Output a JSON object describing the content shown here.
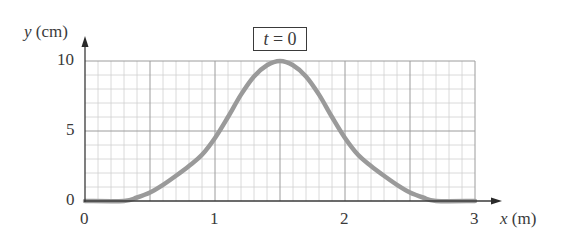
{
  "chart_data": {
    "type": "line",
    "title": "t = 0",
    "xlabel": "x (m)",
    "ylabel": "y (cm)",
    "xlim": [
      0,
      3
    ],
    "ylim": [
      0,
      10
    ],
    "x_ticks": [
      "0",
      "1",
      "2",
      "3"
    ],
    "y_ticks": [
      "0",
      "5",
      "10"
    ],
    "grid": true,
    "grid_minor_x_step": 0.1,
    "grid_minor_y_step": 1,
    "legend": null,
    "series": [
      {
        "name": "pulse at t = 0",
        "color": "#9a9a9a",
        "x": [
          0,
          0.3,
          0.4,
          0.5,
          0.6,
          0.7,
          0.8,
          0.9,
          1.0,
          1.1,
          1.2,
          1.3,
          1.4,
          1.5,
          1.6,
          1.7,
          1.8,
          1.9,
          2.0,
          2.1,
          2.2,
          2.3,
          2.4,
          2.5,
          2.6,
          2.7,
          3.0
        ],
        "y": [
          0,
          0,
          0.25,
          0.6,
          1.15,
          1.8,
          2.5,
          3.3,
          4.5,
          6.0,
          7.6,
          8.9,
          9.7,
          10,
          9.7,
          8.9,
          7.6,
          6.0,
          4.5,
          3.3,
          2.5,
          1.8,
          1.15,
          0.6,
          0.25,
          0,
          0
        ]
      }
    ]
  },
  "labels": {
    "y_axis": "y",
    "y_unit": "(cm)",
    "x_axis": "x",
    "x_unit": "(m)",
    "time_box_var": "t",
    "time_box_rest": " = 0",
    "y_tick_0": "0",
    "y_tick_5": "5",
    "y_tick_10": "10",
    "x_tick_0": "0",
    "x_tick_1": "1",
    "x_tick_2": "2",
    "x_tick_3": "3"
  },
  "colors": {
    "axis": "#3a3a3a",
    "grid_major": "#9c9c9c",
    "grid_minor": "#d0d0d0",
    "curve": "#9a9a9a"
  }
}
